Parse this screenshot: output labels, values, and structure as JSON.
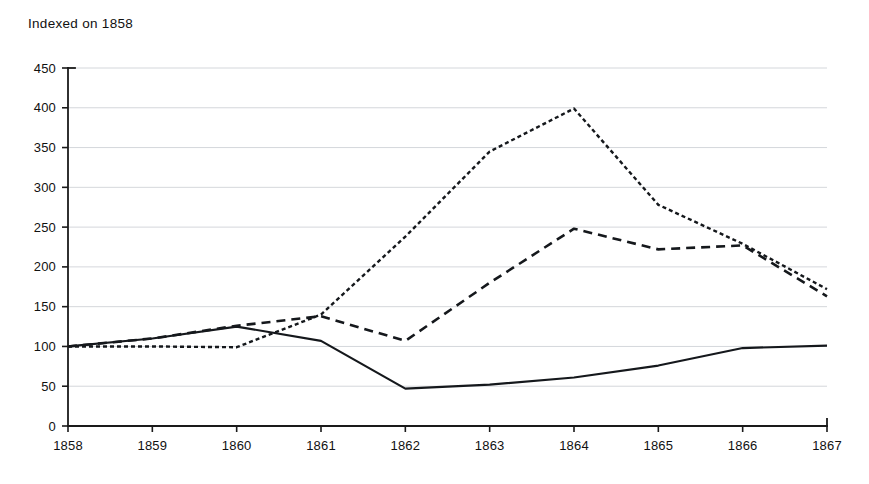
{
  "chart_data": {
    "type": "line",
    "title": "Indexed on 1858",
    "xlabel": "",
    "ylabel": "",
    "x": [
      1858,
      1859,
      1860,
      1861,
      1862,
      1863,
      1864,
      1865,
      1866,
      1867
    ],
    "categories": [
      "1858",
      "1859",
      "1860",
      "1861",
      "1862",
      "1863",
      "1864",
      "1865",
      "1866",
      "1867"
    ],
    "xlim": [
      1858,
      1867
    ],
    "ylim": [
      0,
      450
    ],
    "y_ticks": [
      0,
      50,
      100,
      150,
      200,
      250,
      300,
      350,
      400,
      450
    ],
    "y_tick_labels": [
      "0",
      "50",
      "100",
      "150",
      "200",
      "250",
      "300",
      "350",
      "400",
      "450"
    ],
    "x_tick_labels": [
      "1858",
      "1859",
      "1860",
      "1861",
      "1862",
      "1863",
      "1864",
      "1865",
      "1866",
      "1867"
    ],
    "grid": true,
    "grid_axis": "y",
    "legend": "none",
    "series": [
      {
        "name": "series-solid",
        "style": "solid",
        "dasharray": "none",
        "color": "#15181c",
        "width": 2.2,
        "values": [
          100,
          110,
          125,
          107,
          47,
          52,
          61,
          76,
          98,
          101
        ]
      },
      {
        "name": "series-short-dash",
        "style": "short-dashed",
        "dasharray": "4,3",
        "color": "#15181c",
        "width": 2.4,
        "values": [
          100,
          100,
          99,
          140,
          238,
          345,
          399,
          278,
          229,
          172
        ]
      },
      {
        "name": "series-long-dash",
        "style": "long-dashed",
        "dasharray": "9,6",
        "color": "#15181c",
        "width": 2.6,
        "values": [
          100,
          110,
          126,
          138,
          107,
          180,
          248,
          222,
          227,
          163
        ]
      }
    ]
  },
  "plot_geometry": {
    "left": 68,
    "right": 827,
    "top": 68,
    "bottom": 426
  }
}
